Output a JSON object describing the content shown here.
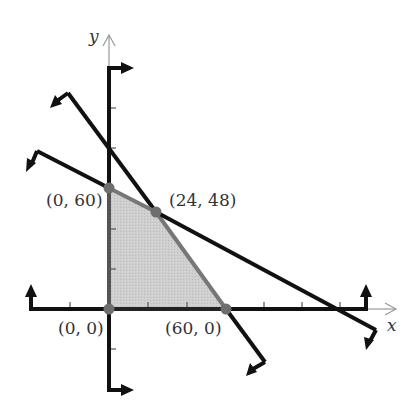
{
  "figure": {
    "type": "feasible-region-graph",
    "axes": {
      "x_label": "x",
      "y_label": "y",
      "tick_marks": true
    },
    "vertices": [
      {
        "label": "(0, 0)",
        "x": 0,
        "y": 0
      },
      {
        "label": "(0, 60)",
        "x": 0,
        "y": 60
      },
      {
        "label": "(24, 48)",
        "x": 24,
        "y": 48
      },
      {
        "label": "(60, 0)",
        "x": 60,
        "y": 0
      }
    ],
    "boundary_lines": [
      {
        "name": "steep-constraint-line",
        "through": [
          [
            0,
            80
          ],
          [
            24,
            48
          ],
          [
            60,
            0
          ]
        ],
        "shade_direction": "below-left"
      },
      {
        "name": "shallow-constraint-line",
        "through": [
          [
            0,
            60
          ],
          [
            24,
            48
          ],
          [
            120,
            0
          ]
        ],
        "shade_direction": "below-left"
      },
      {
        "name": "x-nonnegative-line",
        "equation": "x = 0",
        "shade_direction": "right"
      },
      {
        "name": "y-nonnegative-line",
        "equation": "y = 0",
        "shade_direction": "up"
      }
    ],
    "feasible_region": {
      "shaded": true,
      "polygon": [
        [
          0,
          0
        ],
        [
          0,
          60
        ],
        [
          24,
          48
        ],
        [
          60,
          0
        ]
      ]
    },
    "colors": {
      "line": "#111111",
      "region_fill": "#c8c8c8",
      "region_edge": "#777777",
      "vertex_dot": "#6e6e6e",
      "thin_axis": "#999999",
      "text": "#333333"
    }
  }
}
